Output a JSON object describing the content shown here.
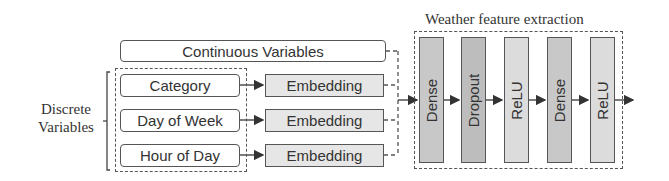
{
  "diagram": {
    "continuous": {
      "label": "Continuous Variables"
    },
    "discrete": {
      "group_label_line1": "Discrete",
      "group_label_line2": "Variables",
      "inputs": [
        {
          "label": "Category"
        },
        {
          "label": "Day of Week"
        },
        {
          "label": "Hour of Day"
        }
      ],
      "embeddings": [
        {
          "label": "Embedding"
        },
        {
          "label": "Embedding"
        },
        {
          "label": "Embedding"
        }
      ]
    },
    "weather": {
      "title": "Weather feature extraction",
      "layers": [
        {
          "label": "Dense",
          "color": "#c8c8c8"
        },
        {
          "label": "Dropout",
          "color": "#bdbdbd"
        },
        {
          "label": "ReLU",
          "color": "#dcdcdc"
        },
        {
          "label": "Dense",
          "color": "#c8c8c8"
        },
        {
          "label": "ReLU",
          "color": "#dcdcdc"
        }
      ]
    },
    "colors": {
      "line": "#444444",
      "embedding_fill": "#e6e6e6"
    }
  }
}
